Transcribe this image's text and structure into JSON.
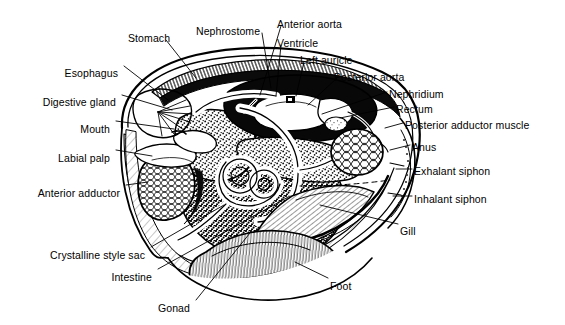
{
  "figure": {
    "background_color": "#ffffff",
    "line_color": "#000000",
    "width": 565,
    "height": 325
  },
  "labels": [
    {
      "id": "stomach",
      "text": "Stomach",
      "x": 128,
      "y": 33,
      "align": "left",
      "leader": [
        [
          166,
          40
        ],
        [
          196,
          78
        ]
      ]
    },
    {
      "id": "nephrostome",
      "text": "Nephrostome",
      "x": 196,
      "y": 26,
      "align": "left",
      "leader": [
        [
          262,
          33
        ],
        [
          271,
          88
        ]
      ]
    },
    {
      "id": "anterior-aorta",
      "text": "Anterior aorta",
      "x": 277,
      "y": 19,
      "align": "left",
      "leader": [
        [
          281,
          26
        ],
        [
          260,
          95
        ]
      ]
    },
    {
      "id": "ventricle",
      "text": "Ventricle",
      "x": 277,
      "y": 38,
      "align": "left",
      "leader": [
        [
          281,
          45
        ],
        [
          276,
          96
        ]
      ]
    },
    {
      "id": "left-auricle",
      "text": "Left auricle",
      "x": 300,
      "y": 55,
      "align": "left",
      "leader": [
        [
          304,
          62
        ],
        [
          296,
          96
        ]
      ]
    },
    {
      "id": "posterior-aorta",
      "text": "Posterior aorta",
      "x": 334,
      "y": 72,
      "align": "left",
      "leader": [
        [
          337,
          78
        ],
        [
          308,
          105
        ]
      ]
    },
    {
      "id": "nephridium",
      "text": "Nephridium",
      "x": 389,
      "y": 89,
      "align": "left",
      "leader": [
        [
          387,
          92
        ],
        [
          322,
          114
        ]
      ]
    },
    {
      "id": "rectum",
      "text": "Rectum",
      "x": 396,
      "y": 104,
      "align": "left",
      "leader": [
        [
          394,
          107
        ],
        [
          340,
          118
        ]
      ]
    },
    {
      "id": "posterior-adductor-muscle",
      "text": "Posterior adductor muscle",
      "x": 405,
      "y": 120,
      "align": "left",
      "leader": [
        [
          403,
          123
        ],
        [
          385,
          128
        ]
      ]
    },
    {
      "id": "anus",
      "text": "Anus",
      "x": 412,
      "y": 142,
      "align": "left",
      "leader": [
        [
          410,
          145
        ],
        [
          390,
          150
        ]
      ]
    },
    {
      "id": "exhalant-siphon",
      "text": "Exhalant siphon",
      "x": 414,
      "y": 166,
      "align": "left",
      "leader": [
        [
          412,
          169
        ],
        [
          396,
          169
        ]
      ]
    },
    {
      "id": "inhalant-siphon",
      "text": "Inhalant siphon",
      "x": 414,
      "y": 194,
      "align": "left",
      "leader": [
        [
          412,
          196
        ],
        [
          393,
          196
        ]
      ]
    },
    {
      "id": "gill",
      "text": "Gill",
      "x": 400,
      "y": 226,
      "align": "left",
      "leader": [
        [
          398,
          224
        ],
        [
          320,
          205
        ]
      ]
    },
    {
      "id": "foot",
      "text": "Foot",
      "x": 330,
      "y": 281,
      "align": "left",
      "leader": [
        [
          328,
          278
        ],
        [
          295,
          262
        ]
      ]
    },
    {
      "id": "gonad",
      "text": "Gonad",
      "x": 190,
      "y": 303,
      "align": "right",
      "leader": [
        [
          196,
          300
        ],
        [
          250,
          233
        ]
      ]
    },
    {
      "id": "intestine",
      "text": "Intestine",
      "x": 152,
      "y": 272,
      "align": "right",
      "leader": [
        [
          158,
          269
        ],
        [
          290,
          196
        ]
      ]
    },
    {
      "id": "crystalline-style-sac",
      "text": "Crystalline style sac",
      "x": 145,
      "y": 250,
      "align": "right",
      "leader": [
        [
          151,
          247
        ],
        [
          224,
          205
        ]
      ]
    },
    {
      "id": "anterior-adductor",
      "text": "Anterior adductor",
      "x": 120,
      "y": 188,
      "align": "right",
      "leader": [
        [
          126,
          185
        ],
        [
          148,
          182
        ]
      ]
    },
    {
      "id": "labial-palp",
      "text": "Labial palp",
      "x": 110,
      "y": 153,
      "align": "right",
      "leader": [
        [
          116,
          150
        ],
        [
          152,
          156
        ]
      ]
    },
    {
      "id": "mouth",
      "text": "Mouth",
      "x": 110,
      "y": 124,
      "align": "right",
      "leader": [
        [
          116,
          121
        ],
        [
          174,
          129
        ]
      ]
    },
    {
      "id": "digestive-gland",
      "text": "Digestive gland",
      "x": 116,
      "y": 97,
      "align": "right",
      "leader": [
        [
          122,
          95
        ],
        [
          172,
          110
        ]
      ]
    },
    {
      "id": "esophagus",
      "text": "Esophagus",
      "x": 118,
      "y": 68,
      "align": "right",
      "leader": [
        [
          124,
          66
        ],
        [
          168,
          100
        ]
      ]
    }
  ]
}
